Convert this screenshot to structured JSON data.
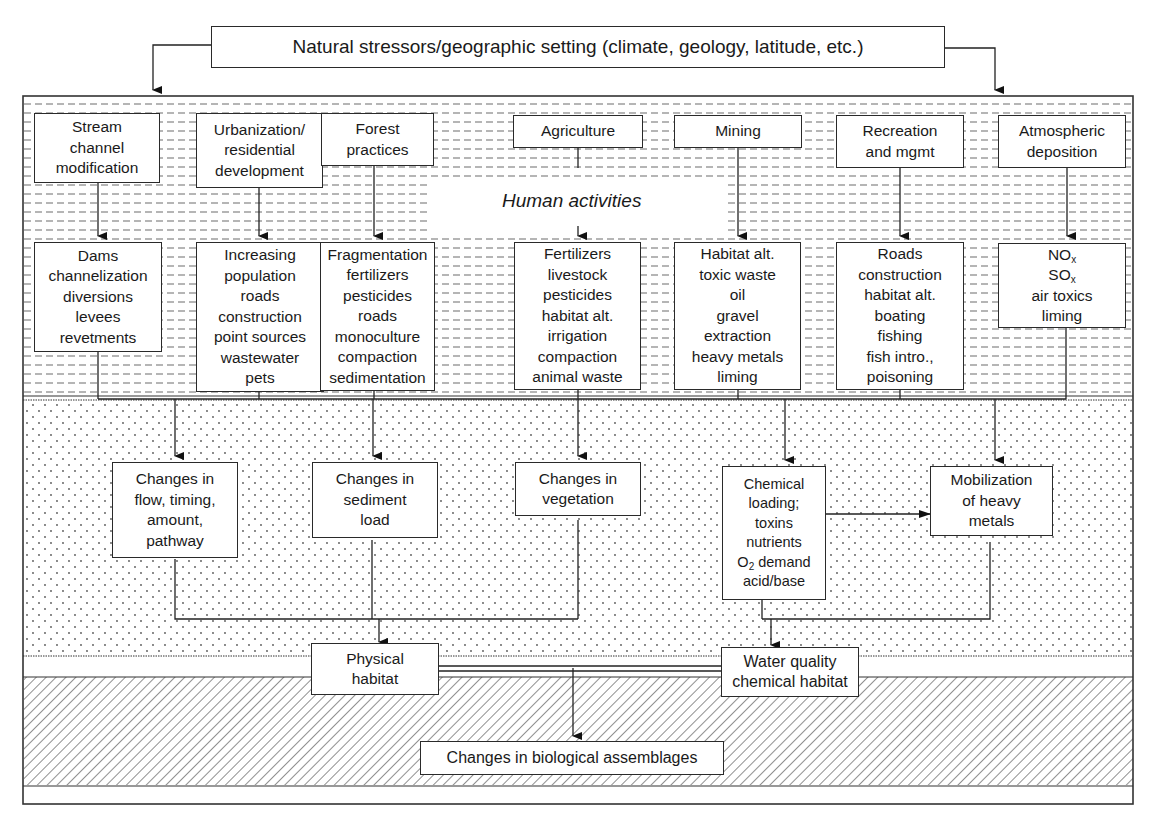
{
  "diagram": {
    "title_box": "Natural stressors/geographic setting (climate, geology, latitude, etc.)",
    "layer_label": "Human activities",
    "activities": [
      {
        "label": [
          "Stream",
          "channel",
          "modification"
        ],
        "effects": [
          "Dams",
          "channelization",
          "diversions",
          "levees",
          "revetments"
        ]
      },
      {
        "label": [
          "Urbanization/",
          "residential",
          "development"
        ],
        "effects": [
          "Increasing",
          "population",
          "roads",
          "construction",
          "point sources",
          "wastewater",
          "pets"
        ]
      },
      {
        "label": [
          "Forest",
          "practices"
        ],
        "effects": [
          "Fragmentation",
          "fertilizers",
          "pesticides",
          "roads",
          "monoculture",
          "compaction",
          "sedimentation"
        ]
      },
      {
        "label": [
          "Agriculture"
        ],
        "effects": [
          "Fertilizers",
          "livestock",
          "pesticides",
          "habitat alt.",
          "irrigation",
          "compaction",
          "animal waste"
        ]
      },
      {
        "label": [
          "Mining"
        ],
        "effects": [
          "Habitat alt.",
          "toxic waste",
          "oil",
          "gravel",
          "extraction",
          "heavy metals",
          "liming"
        ]
      },
      {
        "label": [
          "Recreation",
          "and mgmt"
        ],
        "effects": [
          "Roads",
          "construction",
          "habitat alt.",
          "boating",
          "fishing",
          "fish intro.,",
          "poisoning"
        ]
      },
      {
        "label": [
          "Atmospheric",
          "deposition"
        ],
        "effects": [
          "NO",
          "SO",
          "air toxics",
          "liming"
        ],
        "effect_subscripts": [
          "x",
          "x"
        ]
      }
    ],
    "changes": [
      {
        "label": [
          "Changes in",
          "flow, timing,",
          "amount,",
          "pathway"
        ]
      },
      {
        "label": [
          "Changes in",
          "sediment",
          "load"
        ]
      },
      {
        "label": [
          "Changes in",
          "vegetation"
        ]
      },
      {
        "label": [
          "Chemical",
          "loading;",
          "toxins",
          "nutrients",
          "O",
          "demand",
          "acid/base"
        ],
        "o2_subscript": "2"
      },
      {
        "label": [
          "Mobilization",
          "of heavy",
          "metals"
        ]
      }
    ],
    "habitats": {
      "physical": [
        "Physical",
        "habitat"
      ],
      "water_quality": [
        "Water quality",
        "chemical habitat"
      ]
    },
    "outcome": "Changes in biological assemblages"
  }
}
